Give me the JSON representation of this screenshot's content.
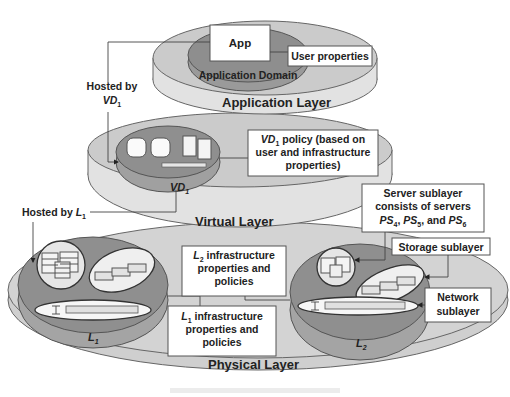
{
  "diagram": {
    "application_layer": {
      "title": "Application Layer",
      "domain_label": "Application Domain",
      "app_label": "App",
      "user_properties_label": "User properties"
    },
    "hosted_by_vd1": {
      "line1": "Hosted by",
      "var": "VD",
      "sub": "1"
    },
    "virtual_layer": {
      "title": "Virtual Layer",
      "vd_label": "VD",
      "vd_sub": "1",
      "policy": {
        "line1_var": "VD",
        "line1_sub": "1",
        "line1_rest": " policy (based on",
        "line2": "user and infrastructure",
        "line3": "properties)"
      }
    },
    "hosted_by_l1": {
      "text": "Hosted by ",
      "var": "L",
      "sub": "1"
    },
    "physical_layer": {
      "title": "Physical Layer",
      "l1_label": "L",
      "l1_sub": "1",
      "l2_label": "L",
      "l2_sub": "2",
      "l2_infra": {
        "var": "L",
        "sub": "2",
        "line1_rest": " infrastructure",
        "line2": "properties and",
        "line3": "policies"
      },
      "l1_infra": {
        "var": "L",
        "sub": "1",
        "line1_rest": " infrastructure",
        "line2": "properties and",
        "line3": "policies"
      },
      "server_sublayer": {
        "line1": "Server sublayer",
        "line2": "consists of servers",
        "ps_var": "PS",
        "subs": [
          "4",
          "5",
          "6"
        ],
        "sep1": ", ",
        "sep2": ", and "
      },
      "storage_sublayer": "Storage sublayer",
      "network_sublayer": {
        "line1": "Network",
        "line2": "sublayer"
      }
    }
  },
  "colors": {
    "layer_light": "#d4d4d4",
    "layer_side": "#e4e4e4",
    "domain_dark": "#9a9a9a",
    "domain_mid": "#a8a8a8",
    "outline": "#555555"
  }
}
